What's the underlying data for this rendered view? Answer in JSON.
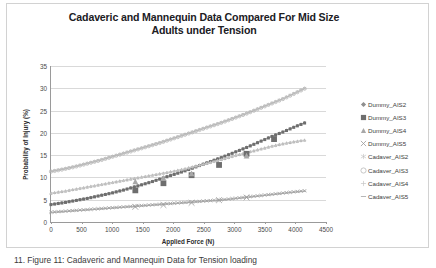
{
  "figure": {
    "caption": "11. Figure 11: Cadaveric and Mannequin Data for Tension loading"
  },
  "chart_data": {
    "type": "scatter",
    "title": "Cadaveric and Mannequin Data Compared For Mid Size Adults under Tension",
    "title_line1": "Cadaveric and Mannequin Data Compared For Mid Size",
    "title_line2": "Adults under Tension",
    "xlabel": "Applied Force (N)",
    "ylabel": "Probability of Injury (%)",
    "xlim": [
      0,
      4500
    ],
    "ylim": [
      0,
      35
    ],
    "xticks": [
      0,
      500,
      1000,
      1500,
      2000,
      2500,
      3000,
      3500,
      4000,
      4500
    ],
    "yticks": [
      0,
      5,
      10,
      15,
      20,
      25,
      30,
      35
    ],
    "grid": "horizontal",
    "legend_position": "right",
    "series": [
      {
        "name": "Dummy_AIS2",
        "marker": "diamond",
        "color": "#8f8f8f",
        "x": [
          0,
          200,
          400,
          600,
          800,
          1000,
          1200,
          1400,
          1600,
          1800,
          2000,
          2200,
          2400,
          2600,
          2800,
          3000,
          3200,
          3400,
          3600,
          3800,
          4000,
          4150
        ],
        "y": [
          4.0,
          4.4,
          4.9,
          5.4,
          6.0,
          6.6,
          7.3,
          8.1,
          8.9,
          9.8,
          10.7,
          11.6,
          12.6,
          13.6,
          14.6,
          15.7,
          16.8,
          18.0,
          19.2,
          20.3,
          21.5,
          22.3
        ]
      },
      {
        "name": "Dummy_AIS3",
        "marker": "square",
        "color": "#6e6e6e",
        "x": [
          0,
          200,
          400,
          600,
          800,
          1000,
          1200,
          1400,
          1600,
          1800,
          2000,
          2200,
          2400,
          2600,
          2800,
          3000,
          3200,
          3400,
          3600,
          3800,
          4000,
          4150
        ],
        "y": [
          3.9,
          4.3,
          4.8,
          5.3,
          5.9,
          6.5,
          7.2,
          8.0,
          8.8,
          9.7,
          10.6,
          11.5,
          12.5,
          13.5,
          14.5,
          15.6,
          16.7,
          17.9,
          19.1,
          20.2,
          21.4,
          22.2
        ]
      },
      {
        "name": "Dummy_AIS4",
        "marker": "triangle",
        "color": "#a8a8a8",
        "x": [
          0,
          200,
          400,
          600,
          800,
          1000,
          1200,
          1400,
          1600,
          1800,
          2000,
          2200,
          2400,
          2600,
          2800,
          3000,
          3200,
          3400,
          3600,
          3800,
          4000,
          4150
        ],
        "y": [
          6.5,
          6.9,
          7.4,
          7.9,
          8.4,
          8.9,
          9.4,
          9.9,
          10.4,
          10.9,
          11.4,
          12.0,
          12.7,
          13.4,
          14.1,
          14.9,
          15.6,
          16.3,
          17.0,
          17.6,
          18.1,
          18.4
        ]
      },
      {
        "name": "Dummy_AIS5",
        "marker": "x",
        "color": "#9b9b9b",
        "x": [
          0,
          200,
          400,
          600,
          800,
          1000,
          1200,
          1400,
          1600,
          1800,
          2000,
          2200,
          2400,
          2600,
          2800,
          3000,
          3200,
          3400,
          3600,
          3800,
          4000,
          4150
        ],
        "y": [
          2.2,
          2.4,
          2.6,
          2.8,
          3.0,
          3.2,
          3.4,
          3.6,
          3.8,
          4.0,
          4.2,
          4.4,
          4.6,
          4.8,
          5.0,
          5.3,
          5.6,
          5.9,
          6.2,
          6.5,
          6.8,
          7.0
        ]
      },
      {
        "name": "Cadaver_AIS2",
        "marker": "asterisk",
        "color": "#bdbdbd",
        "x": [
          0,
          200,
          400,
          600,
          800,
          1000,
          1200,
          1400,
          1600,
          1800,
          2000,
          2200,
          2400,
          2600,
          2800,
          3000,
          3200,
          3400,
          3600,
          3800,
          4000,
          4150
        ],
        "y": [
          11.4,
          11.9,
          12.5,
          13.2,
          13.9,
          14.7,
          15.5,
          16.3,
          17.1,
          17.9,
          18.8,
          19.7,
          20.6,
          21.5,
          22.4,
          23.4,
          24.4,
          25.5,
          26.6,
          27.7,
          29.0,
          30.0
        ]
      },
      {
        "name": "Cadaver_AIS3",
        "marker": "circle",
        "color": "#b0b0b0",
        "x": [
          0,
          200,
          400,
          600,
          800,
          1000,
          1200,
          1400,
          1600,
          1800,
          2000,
          2200,
          2400,
          2600,
          2800,
          3000,
          3200,
          3400,
          3600,
          3800,
          4000,
          4150
        ],
        "y": [
          11.3,
          11.8,
          12.4,
          13.1,
          13.8,
          14.6,
          15.4,
          16.2,
          17.0,
          17.8,
          18.7,
          19.6,
          20.5,
          21.4,
          22.3,
          23.3,
          24.3,
          25.4,
          26.5,
          27.6,
          28.9,
          29.9
        ]
      },
      {
        "name": "Cadaver_AIS4",
        "marker": "plus",
        "color": "#c6c6c6",
        "x": [
          0,
          200,
          400,
          600,
          800,
          1000,
          1200,
          1400,
          1600,
          1800,
          2000,
          2200,
          2400,
          2600,
          2800,
          3000,
          3200,
          3400,
          3600,
          3800,
          4000,
          4150
        ],
        "y": [
          6.4,
          6.8,
          7.3,
          7.8,
          8.3,
          8.8,
          9.3,
          9.8,
          10.3,
          10.8,
          11.3,
          11.9,
          12.6,
          13.3,
          14.0,
          14.8,
          15.5,
          16.2,
          16.9,
          17.5,
          18.0,
          18.3
        ]
      },
      {
        "name": "Cadaver_AIS5",
        "marker": "dash",
        "color": "#a5a5a5",
        "x": [
          0,
          200,
          400,
          600,
          800,
          1000,
          1200,
          1400,
          1600,
          1800,
          2000,
          2200,
          2400,
          2600,
          2800,
          3000,
          3200,
          3400,
          3600,
          3800,
          4000,
          4150
        ],
        "y": [
          2.1,
          2.3,
          2.5,
          2.7,
          2.9,
          3.1,
          3.3,
          3.5,
          3.7,
          3.9,
          4.1,
          4.3,
          4.5,
          4.7,
          4.9,
          5.2,
          5.5,
          5.8,
          6.1,
          6.4,
          6.7,
          6.9
        ]
      }
    ],
    "highlight_points": [
      {
        "series": "Dummy_AIS3",
        "x": 1380,
        "y": 7.1
      },
      {
        "series": "Dummy_AIS3",
        "x": 1840,
        "y": 8.7
      },
      {
        "series": "Dummy_AIS3",
        "x": 2300,
        "y": 10.5
      },
      {
        "series": "Dummy_AIS3",
        "x": 2750,
        "y": 12.8
      },
      {
        "series": "Dummy_AIS3",
        "x": 3200,
        "y": 15.3
      },
      {
        "series": "Dummy_AIS3",
        "x": 3650,
        "y": 18.6
      },
      {
        "series": "Dummy_AIS4",
        "x": 1380,
        "y": 9.1
      },
      {
        "series": "Dummy_AIS4",
        "x": 1840,
        "y": 9.9
      },
      {
        "series": "Dummy_AIS4",
        "x": 2300,
        "y": 10.9
      },
      {
        "series": "Dummy_AIS4",
        "x": 3200,
        "y": 14.9
      },
      {
        "series": "Dummy_AIS5",
        "x": 1380,
        "y": 3.4
      },
      {
        "series": "Dummy_AIS5",
        "x": 1840,
        "y": 3.8
      },
      {
        "series": "Dummy_AIS5",
        "x": 2300,
        "y": 4.3
      },
      {
        "series": "Dummy_AIS5",
        "x": 2750,
        "y": 4.9
      },
      {
        "series": "Dummy_AIS5",
        "x": 3200,
        "y": 5.5
      }
    ]
  }
}
